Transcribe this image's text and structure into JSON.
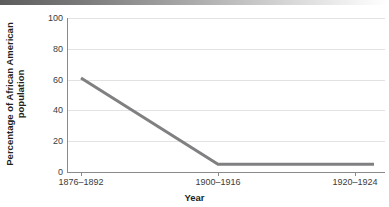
{
  "figure": {
    "top_rule": "gradient-rule"
  },
  "chart_data": {
    "type": "line",
    "title": "",
    "subtitle": "",
    "xlabel": "Year",
    "ylabel": "Percentage of African American population",
    "ylabel_line1": "Percentage of African American",
    "ylabel_line2": "population",
    "categories": [
      "1876–1892",
      "1900–1916",
      "1920–1924"
    ],
    "values": [
      61,
      5,
      5
    ],
    "series": [
      {
        "name": "Percentage of African American population",
        "values": [
          61,
          5,
          5
        ],
        "color": "#808083"
      }
    ],
    "ylim": [
      0,
      100
    ],
    "yticks": [
      100,
      80,
      60,
      40,
      20,
      0
    ],
    "ytick_labels": [
      "100",
      "80",
      "60",
      "40",
      "20",
      "0"
    ],
    "grid": true,
    "grid_axis": "y",
    "legend": false,
    "legend_position": "none",
    "axis_color": "#8a8a8d",
    "grid_color": "#e2e2e4",
    "text_color": "#231f20",
    "tick_text_color": "#3b3b3d",
    "line_width_px": 3
  }
}
